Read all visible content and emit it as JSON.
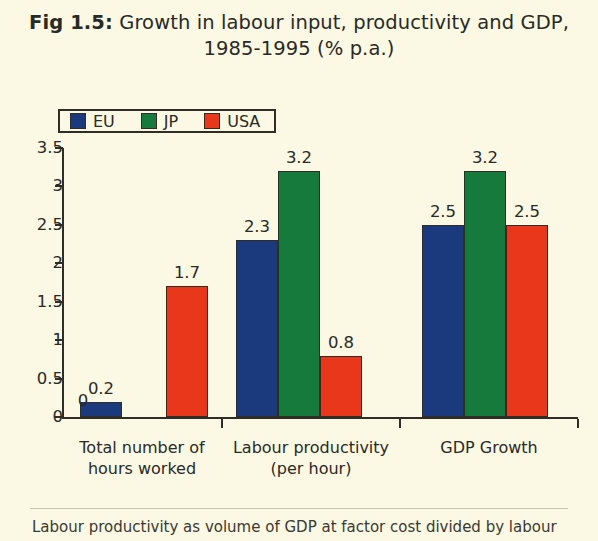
{
  "title": {
    "label": "Fig 1.5:",
    "text": "Growth in labour input, productivity and GDP, 1985-1995 (% p.a.)"
  },
  "footnote": {
    "text": "Labour productivity as volume of GDP at factor cost divided by labour"
  },
  "colors": {
    "background": "#fbf8e4",
    "eu": "#1b3a7d",
    "jp": "#157a3c",
    "usa": "#e8371a",
    "axis": "#2e2e26",
    "text": "#2a2a24"
  },
  "chart_data": {
    "type": "bar",
    "title": "Fig 1.5: Growth in labour input, productivity and GDP, 1985-1995 (% p.a.)",
    "xlabel": "",
    "ylabel": "",
    "ylim": [
      0,
      3.5
    ],
    "yticks": [
      "0",
      "0.5",
      "1",
      "1.5",
      "2",
      "2.5",
      "3",
      "3.5"
    ],
    "ytick_values": [
      0,
      0.5,
      1,
      1.5,
      2,
      2.5,
      3,
      3.5
    ],
    "grid": false,
    "legend_position": "top-left",
    "categories": [
      "Total number of hours worked",
      "Labour productivity (per hour)",
      "GDP Growth"
    ],
    "category_lines": [
      [
        "Total number of",
        "hours worked"
      ],
      [
        "Labour productivity",
        "(per hour)"
      ],
      [
        "GDP Growth",
        ""
      ]
    ],
    "series": [
      {
        "name": "EU",
        "color": "#1b3a7d",
        "values": [
          0.2,
          2.3,
          2.5
        ],
        "labels": [
          "0.2",
          "2.3",
          "2.5"
        ]
      },
      {
        "name": "JP",
        "color": "#157a3c",
        "values": [
          0,
          3.2,
          3.2
        ],
        "labels": [
          "0",
          "3.2",
          "3.2"
        ]
      },
      {
        "name": "USA",
        "color": "#e8371a",
        "values": [
          1.7,
          0.8,
          2.5
        ],
        "labels": [
          "1.7",
          "0.8",
          "2.5"
        ]
      }
    ]
  }
}
